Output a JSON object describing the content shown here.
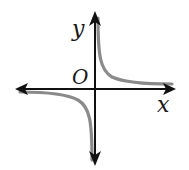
{
  "diagram": {
    "type": "function-graph",
    "axes": {
      "x_label": "x",
      "y_label": "y",
      "origin_label": "O"
    },
    "colors": {
      "axes": "#111111",
      "curve": "#8a8a8a",
      "labels": "#1a1a1a"
    }
  }
}
